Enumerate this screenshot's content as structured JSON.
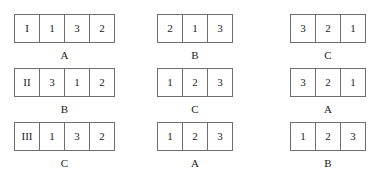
{
  "groups": [
    {
      "id": "group-1",
      "column": 1,
      "row": 1,
      "cells": [
        "I",
        "1",
        "3",
        "2"
      ],
      "caption": "A"
    },
    {
      "id": "group-2",
      "column": 2,
      "row": 1,
      "cells": [
        "2",
        "1",
        "3"
      ],
      "caption": "B"
    },
    {
      "id": "group-3",
      "column": 3,
      "row": 1,
      "cells": [
        "3",
        "2",
        "1"
      ],
      "caption": "C"
    },
    {
      "id": "group-4",
      "column": 1,
      "row": 2,
      "cells": [
        "II",
        "3",
        "1",
        "2"
      ],
      "caption": "B"
    },
    {
      "id": "group-5",
      "column": 2,
      "row": 2,
      "cells": [
        "1",
        "2",
        "3"
      ],
      "caption": "C"
    },
    {
      "id": "group-6",
      "column": 3,
      "row": 2,
      "cells": [
        "3",
        "2",
        "1"
      ],
      "caption": "A"
    },
    {
      "id": "group-7",
      "column": 1,
      "row": 3,
      "cells": [
        "III",
        "1",
        "3",
        "2"
      ],
      "caption": "C"
    },
    {
      "id": "group-8",
      "column": 2,
      "row": 3,
      "cells": [
        "1",
        "2",
        "3"
      ],
      "caption": "A"
    },
    {
      "id": "group-9",
      "column": 3,
      "row": 3,
      "cells": [
        "1",
        "2",
        "3"
      ],
      "caption": "B"
    }
  ],
  "style": {
    "border_color": "#6e6e6e",
    "text_color": "#1a1a1a",
    "background_color": "#ffffff"
  }
}
